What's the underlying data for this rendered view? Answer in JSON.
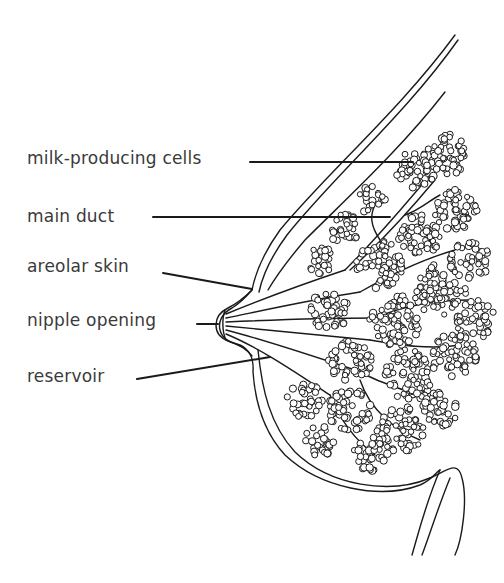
{
  "diagram": {
    "line_color": "#1a1a1a",
    "text_color": "#3a3a3a",
    "labels": [
      {
        "id": "milk-producing-cells",
        "text": "milk-producing cells",
        "x": 27,
        "y": 148,
        "line": [
          [
            250,
            162
          ],
          [
            413,
            162
          ]
        ]
      },
      {
        "id": "main-duct",
        "text": "main duct",
        "x": 27,
        "y": 206,
        "line": [
          [
            153,
            217
          ],
          [
            390,
            217
          ]
        ]
      },
      {
        "id": "areolar-skin",
        "text": "areolar skin",
        "x": 27,
        "y": 256,
        "line": [
          [
            163,
            273
          ],
          [
            252,
            289
          ]
        ]
      },
      {
        "id": "nipple-opening",
        "text": "nipple opening",
        "x": 27,
        "y": 310,
        "line": [
          [
            197,
            324
          ],
          [
            218,
            324
          ]
        ]
      },
      {
        "id": "reservoir",
        "text": "reservoir",
        "x": 27,
        "y": 366,
        "line": [
          [
            137,
            379
          ],
          [
            270,
            357
          ]
        ]
      }
    ]
  }
}
